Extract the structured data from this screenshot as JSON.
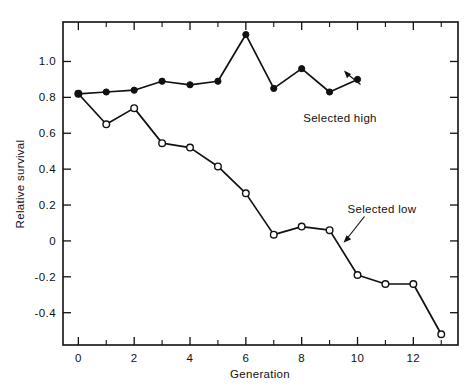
{
  "chart_data": {
    "type": "line",
    "title": "",
    "xlabel": "Generation",
    "ylabel": "Relative survival",
    "xlim": [
      -0.55,
      13.6
    ],
    "ylim": [
      -0.58,
      1.22
    ],
    "grid": false,
    "legend_position": "inline-annotations",
    "x_ticks_major": [
      0,
      2,
      4,
      6,
      8,
      10,
      12
    ],
    "x_tick_labels": [
      "0",
      "2",
      "4",
      "6",
      "8",
      "10",
      "12"
    ],
    "x_ticks_minor": [
      1,
      3,
      5,
      7,
      9,
      11,
      13
    ],
    "y_ticks_major": [
      1.0,
      0.8,
      0.6,
      0.4,
      0.2,
      0,
      -0.2,
      -0.4
    ],
    "y_tick_labels": [
      "1.0",
      "0.8",
      "0.6",
      "0.4",
      "0.2",
      "0",
      "-0.2",
      "-0.4"
    ],
    "series": [
      {
        "name": "Selected high",
        "marker": "filled-circle",
        "x": [
          0,
          1,
          2,
          3,
          4,
          5,
          6,
          7,
          8,
          9,
          10
        ],
        "values": [
          0.82,
          0.83,
          0.84,
          0.89,
          0.87,
          0.89,
          1.15,
          0.85,
          0.96,
          0.83,
          0.9
        ]
      },
      {
        "name": "Selected low",
        "marker": "open-circle",
        "x": [
          0,
          1,
          2,
          3,
          4,
          5,
          6,
          7,
          8,
          9,
          10,
          11,
          12,
          13
        ],
        "values": [
          0.82,
          0.65,
          0.74,
          0.545,
          0.52,
          0.415,
          0.265,
          0.035,
          0.08,
          0.06,
          -0.19,
          -0.24,
          -0.24,
          -0.52
        ]
      }
    ],
    "annotations": [
      {
        "text": "Selected high",
        "points_to_series": "Selected high"
      },
      {
        "text": "Selected low",
        "points_to_series": "Selected low"
      }
    ]
  },
  "labels": {
    "x_axis_title": "Generation",
    "y_axis_title": "Relative survival",
    "annotation_high": "Selected high",
    "annotation_low": "Selected low"
  },
  "colors": {
    "ink": "#111111",
    "background": "#ffffff",
    "marker_open_fill": "#ffffff"
  }
}
